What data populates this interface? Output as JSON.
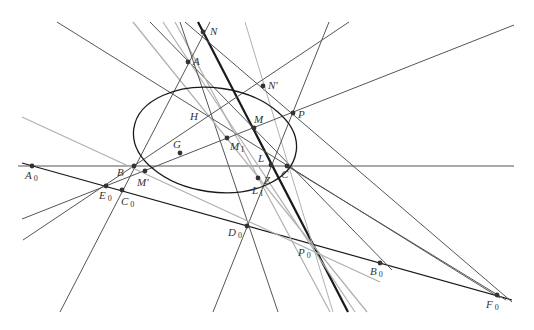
{
  "figure": {
    "type": "projective-geometry-construction",
    "width": 534,
    "height": 330,
    "colors": {
      "background": "#ffffff",
      "dark_line": "#1a1a1a",
      "mid_line": "#555555",
      "light_line": "#b0b0b0",
      "point": "#333333",
      "label": "#333333"
    }
  },
  "ellipse": {
    "cx": 215,
    "cy": 140,
    "rx": 82,
    "ry": 52,
    "rotate": 8
  },
  "points": [
    {
      "id": "A",
      "label": "A",
      "sub": "",
      "x": 188,
      "y": 62,
      "lx": 193,
      "ly": 65,
      "dot": true
    },
    {
      "id": "N",
      "label": "N",
      "sub": "",
      "x": 203,
      "y": 32,
      "lx": 210,
      "ly": 35,
      "dot": true
    },
    {
      "id": "Np",
      "label": "N'",
      "sub": "",
      "x": 263,
      "y": 86,
      "lx": 268,
      "ly": 89,
      "dot": true
    },
    {
      "id": "H",
      "label": "H",
      "sub": "",
      "x": 205,
      "y": 117,
      "lx": 190,
      "ly": 120,
      "dot": false
    },
    {
      "id": "M",
      "label": "M",
      "sub": "",
      "x": 254,
      "y": 128,
      "lx": 254,
      "ly": 123,
      "dot": true
    },
    {
      "id": "P",
      "label": "P",
      "sub": "",
      "x": 293,
      "y": 113,
      "lx": 298,
      "ly": 118,
      "dot": true
    },
    {
      "id": "M1",
      "label": "M",
      "sub": "I",
      "x": 227,
      "y": 138,
      "lx": 230,
      "ly": 150,
      "dot": true
    },
    {
      "id": "G",
      "label": "G",
      "sub": "",
      "x": 180,
      "y": 153,
      "lx": 173,
      "ly": 148,
      "dot": true
    },
    {
      "id": "B",
      "label": "B",
      "sub": "",
      "x": 134,
      "y": 166,
      "lx": 117,
      "ly": 176,
      "dot": true
    },
    {
      "id": "C",
      "label": "C",
      "sub": "",
      "x": 287,
      "y": 166,
      "lx": 281,
      "ly": 178,
      "dot": true
    },
    {
      "id": "L",
      "label": "L",
      "sub": "",
      "x": 271,
      "y": 165,
      "lx": 258,
      "ly": 162,
      "dot": true
    },
    {
      "id": "Z",
      "label": "Z",
      "sub": "",
      "x": 258,
      "y": 178,
      "lx": 264,
      "ly": 184,
      "dot": true
    },
    {
      "id": "L1",
      "label": "L",
      "sub": "I",
      "x": 258,
      "y": 178,
      "lx": 252,
      "ly": 194,
      "dot": false
    },
    {
      "id": "Mp",
      "label": "M'",
      "sub": "",
      "x": 145,
      "y": 171,
      "lx": 137,
      "ly": 186,
      "dot": true
    },
    {
      "id": "A0",
      "label": "A",
      "sub": "0",
      "x": 32,
      "y": 166,
      "lx": 25,
      "ly": 179,
      "dot": true
    },
    {
      "id": "E0",
      "label": "E",
      "sub": "0",
      "x": 106,
      "y": 186,
      "lx": 99,
      "ly": 199,
      "dot": true
    },
    {
      "id": "C0",
      "label": "C",
      "sub": "0",
      "x": 122,
      "y": 190,
      "lx": 121,
      "ly": 205,
      "dot": true
    },
    {
      "id": "D0",
      "label": "D",
      "sub": "0",
      "x": 247,
      "y": 226,
      "lx": 228,
      "ly": 236,
      "dot": true
    },
    {
      "id": "P0",
      "label": "P",
      "sub": "0",
      "x": 312,
      "y": 244,
      "lx": 298,
      "ly": 256,
      "dot": false
    },
    {
      "id": "B0",
      "label": "B",
      "sub": "0",
      "x": 380,
      "y": 263,
      "lx": 370,
      "ly": 275,
      "dot": true
    },
    {
      "id": "F0",
      "label": "F",
      "sub": "0",
      "x": 497,
      "y": 295,
      "lx": 486,
      "ly": 308,
      "dot": true
    }
  ],
  "lines": [
    {
      "name": "axis-horizontal",
      "x1": 18,
      "y1": 166,
      "x2": 514,
      "y2": 166,
      "tone": "mid",
      "w": 1.1
    },
    {
      "name": "line-A0-F0",
      "x1": 22,
      "y1": 163,
      "x2": 512,
      "y2": 300,
      "tone": "dark",
      "w": 1.2
    },
    {
      "name": "line-N-bold",
      "x1": 198,
      "y1": 22,
      "x2": 348,
      "y2": 312,
      "tone": "dark",
      "w": 2.2
    },
    {
      "name": "line-topleft-C",
      "x1": 57,
      "y1": 22,
      "x2": 500,
      "y2": 298,
      "tone": "mid",
      "w": 1.0
    },
    {
      "name": "line-A-C-B0",
      "x1": 150,
      "y1": 22,
      "x2": 392,
      "y2": 270,
      "tone": "mid",
      "w": 1.0
    },
    {
      "name": "line-A-P0-a",
      "x1": 163,
      "y1": 22,
      "x2": 355,
      "y2": 312,
      "tone": "light",
      "w": 1.2
    },
    {
      "name": "line-A-P0-b",
      "x1": 175,
      "y1": 22,
      "x2": 330,
      "y2": 312,
      "tone": "light",
      "w": 1.2
    },
    {
      "name": "line-A-D0",
      "x1": 180,
      "y1": 22,
      "x2": 278,
      "y2": 312,
      "tone": "mid",
      "w": 1.0
    },
    {
      "name": "line-light-top",
      "x1": 133,
      "y1": 22,
      "x2": 367,
      "y2": 312,
      "tone": "light",
      "w": 1.3
    },
    {
      "name": "line-N-B",
      "x1": 210,
      "y1": 22,
      "x2": 60,
      "y2": 312,
      "tone": "mid",
      "w": 1.0
    },
    {
      "name": "line-Np-P0",
      "x1": 245,
      "y1": 22,
      "x2": 333,
      "y2": 312,
      "tone": "light",
      "w": 1.0
    },
    {
      "name": "line-N-Np-F0",
      "x1": 185,
      "y1": 22,
      "x2": 512,
      "y2": 302,
      "tone": "mid",
      "w": 1.0
    },
    {
      "name": "line-P-D0",
      "x1": 329,
      "y1": 22,
      "x2": 213,
      "y2": 312,
      "tone": "mid",
      "w": 1.0
    },
    {
      "name": "line-H-P-top",
      "x1": 349,
      "y1": 22,
      "x2": 23,
      "y2": 240,
      "tone": "mid",
      "w": 1.0
    },
    {
      "name": "line-G-P-right",
      "x1": 22,
      "y1": 219,
      "x2": 514,
      "y2": 25,
      "tone": "mid",
      "w": 1.0
    },
    {
      "name": "line-light-left",
      "x1": 22,
      "y1": 117,
      "x2": 380,
      "y2": 282,
      "tone": "light",
      "w": 1.2
    },
    {
      "name": "line-C-B0",
      "x1": 287,
      "y1": 166,
      "x2": 506,
      "y2": 300,
      "tone": "mid",
      "w": 1.0
    }
  ],
  "caption": ""
}
